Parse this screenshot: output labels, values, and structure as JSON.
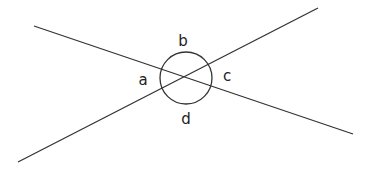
{
  "diagram": {
    "type": "intersecting-lines-angles",
    "stroke_color": "#333333",
    "lines": [
      {
        "id": "line-1",
        "x1": 34,
        "y1": 26,
        "x2": 353,
        "y2": 134
      },
      {
        "id": "line-2",
        "x1": 18,
        "y1": 162,
        "x2": 318,
        "y2": 8
      }
    ],
    "circle": {
      "cx": 186,
      "cy": 78,
      "r": 26
    },
    "angles": [
      {
        "label": "a",
        "x": 143,
        "y": 80
      },
      {
        "label": "b",
        "x": 183,
        "y": 41
      },
      {
        "label": "c",
        "x": 227,
        "y": 76
      },
      {
        "label": "d",
        "x": 186,
        "y": 119
      }
    ]
  }
}
